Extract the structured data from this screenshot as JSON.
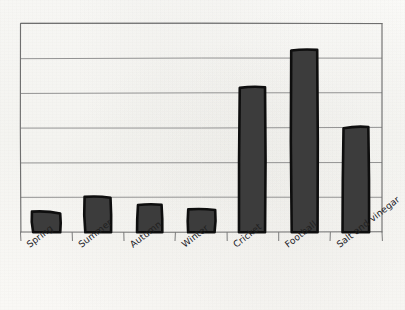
{
  "chart_data": {
    "type": "bar",
    "title": "",
    "subtitle": "",
    "xlabel": "",
    "ylabel": "",
    "categories": [
      "Spring",
      "Summer",
      "Autumn",
      "Winter",
      "Cricket",
      "Football",
      "Salt and vinegar"
    ],
    "values": [
      0.55,
      1.0,
      0.78,
      0.64,
      4.15,
      5.25,
      3.0
    ],
    "ylim": [
      0,
      6
    ],
    "yticks": [
      0,
      1,
      2,
      3,
      4,
      5,
      6
    ],
    "ytick_labels": [
      "",
      "",
      "",
      "",
      "",
      "",
      ""
    ],
    "grid": true,
    "grid_axis": "y",
    "legend": false,
    "legend_position": "none",
    "series": [
      {
        "name": "",
        "values": [
          0.55,
          1.0,
          0.78,
          0.64,
          4.15,
          5.25,
          3.0
        ]
      }
    ],
    "style": "hand-drawn",
    "bar_fill_color": "#3c3c3c",
    "bar_outline_color": "#0e0e0e",
    "grid_color": "#8d8d8d",
    "axis_color": "#6f6f6f",
    "background_color": "#fbfaf7",
    "tick_label_rotation": -38
  },
  "axes": {
    "x_tick_labels": [
      "Spring",
      "Summer",
      "Autumn",
      "Winter",
      "Cricket",
      "Football",
      "Salt and vinegar"
    ],
    "y_tick_labels": []
  }
}
